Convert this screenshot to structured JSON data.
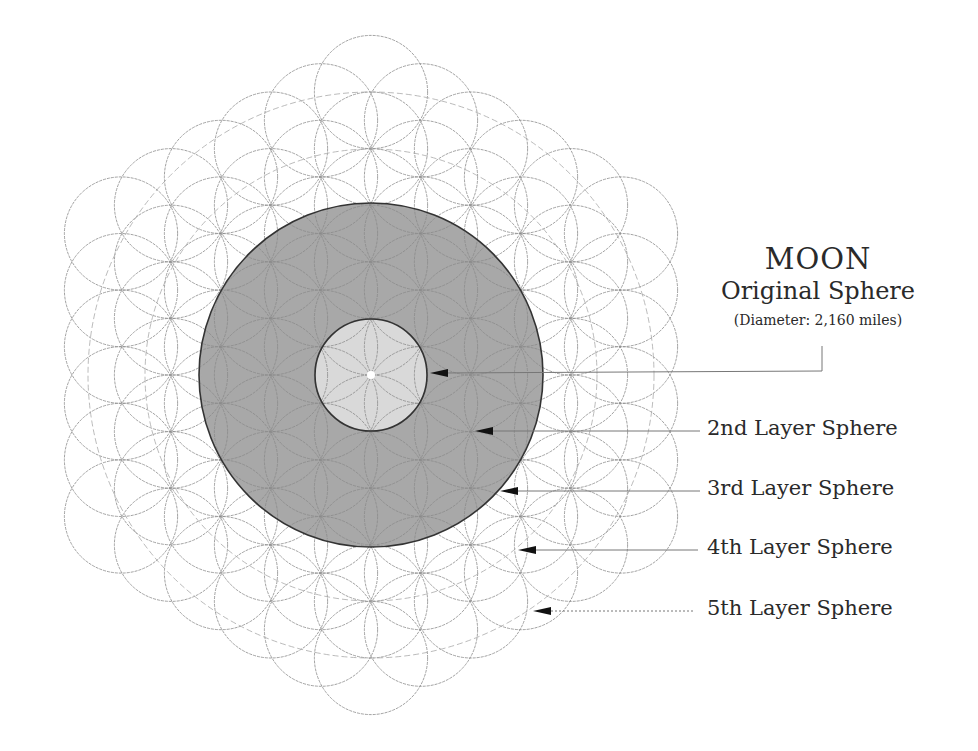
{
  "title": "MOON",
  "subtitle": "Original Sphere",
  "diameter_note": "(Diameter:  2,160 miles)",
  "labels": [
    {
      "text": "2nd Layer Sphere",
      "y": 431
    },
    {
      "text": "3rd Layer Sphere",
      "y": 491
    },
    {
      "text": "4th Layer Sphere",
      "y": 550
    },
    {
      "text": "5th Layer Sphere",
      "y": 611
    }
  ],
  "geometry": {
    "center": [
      371,
      375
    ],
    "unit_radius": 56.6,
    "hex_step_x": 50,
    "hex_step_y": 28.3,
    "rings": 5,
    "outer_disc_radius": 172,
    "inner_disc_radius": 56,
    "guide_circle_radii": [
      170,
      226,
      283
    ]
  },
  "colors": {
    "background": "#ffffff",
    "lattice_stroke": "#8a8a8a",
    "outer_disc_fill": "#a8a8a8",
    "inner_disc_fill": "#d9d9d9",
    "disc_stroke": "#333333",
    "center_dot": "#ffffff",
    "arrow": "#111111",
    "leader_line": "#777777"
  },
  "arrows": [
    {
      "name": "moon",
      "tip": [
        430,
        373
      ],
      "end": [
        822,
        371
      ],
      "elbow_to_y": 346,
      "dotted": false
    },
    {
      "name": "layer-2",
      "tip": [
        475,
        431
      ],
      "end": [
        700,
        431
      ],
      "dotted": false
    },
    {
      "name": "layer-3",
      "tip": [
        500,
        491
      ],
      "end": [
        700,
        491
      ],
      "dotted": false
    },
    {
      "name": "layer-4",
      "tip": [
        518,
        550
      ],
      "end": [
        698,
        550
      ],
      "dotted": false
    },
    {
      "name": "layer-5",
      "tip": [
        533,
        611
      ],
      "end": [
        694,
        611
      ],
      "dotted": true
    }
  ]
}
